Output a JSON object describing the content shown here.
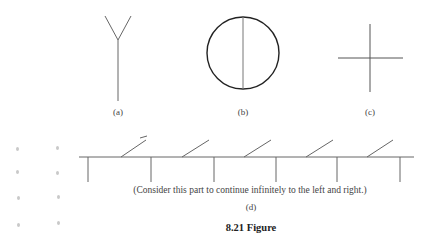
{
  "figure": {
    "caption": "8.21 Figure",
    "panels": [
      {
        "id": "a",
        "label": "(a)",
        "shape": "Y-shape: vertical stem with two branches at top"
      },
      {
        "id": "b",
        "label": "(b)",
        "shape": "circle with vertical diameter"
      },
      {
        "id": "c",
        "label": "(c)",
        "shape": "plus / cross"
      },
      {
        "id": "d",
        "label": "(d)",
        "shape": "infinite horizontal line with downward vertical ticks and upward diagonal segments",
        "note": "(Consider this part to continue infinitely to the left and right.)"
      }
    ]
  },
  "colors": {
    "stroke": "#555555",
    "circle_stroke": "#222222",
    "text": "#444444",
    "background": "#ffffff"
  }
}
